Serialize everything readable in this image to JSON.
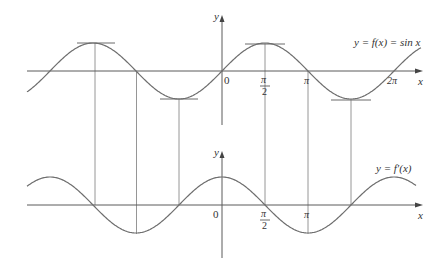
{
  "top_graph": {
    "y_axis_label": "y",
    "x_axis_label": "x",
    "origin_label": "0",
    "function_label": "y = f(x) = sin x",
    "ticks": [
      {
        "num": "π",
        "den": "2",
        "value": "π/2"
      },
      {
        "num": "π",
        "den": "",
        "value": "π"
      },
      {
        "num": "2π",
        "den": "",
        "value": "2π"
      }
    ]
  },
  "bottom_graph": {
    "y_axis_label": "y",
    "x_axis_label": "x",
    "origin_label": "0",
    "function_label": "y = f′(x)",
    "ticks": [
      {
        "num": "π",
        "den": "2",
        "value": "π/2"
      },
      {
        "num": "π",
        "den": "",
        "value": "π"
      }
    ]
  },
  "chart_data": [
    {
      "type": "line",
      "title": "y = f(x) = sin x",
      "xlabel": "x",
      "ylabel": "y",
      "x_range": [
        "-2.2π",
        "2.4π"
      ],
      "horizontal_tangents_at": [
        "-3π/2",
        "-π/2",
        "π/2",
        "3π/2"
      ],
      "x_tick_labels": [
        "0",
        "π/2",
        "π",
        "2π"
      ],
      "series": [
        {
          "name": "sin x",
          "x": [
            "-2π",
            "-3π/2",
            "-π",
            "-π/2",
            "0",
            "π/2",
            "π",
            "3π/2",
            "2π"
          ],
          "values": [
            0,
            1,
            0,
            -1,
            0,
            1,
            0,
            -1,
            0
          ]
        }
      ]
    },
    {
      "type": "line",
      "title": "y = f′(x)",
      "xlabel": "x",
      "ylabel": "y",
      "x_range": [
        "-2.2π",
        "2.4π"
      ],
      "x_tick_labels": [
        "0",
        "π/2",
        "π"
      ],
      "series": [
        {
          "name": "f′(x) = cos x",
          "x": [
            "-2π",
            "-3π/2",
            "-π",
            "-π/2",
            "0",
            "π/2",
            "π",
            "3π/2",
            "2π"
          ],
          "values": [
            1,
            0,
            -1,
            0,
            1,
            0,
            -1,
            0,
            1
          ]
        }
      ]
    }
  ]
}
